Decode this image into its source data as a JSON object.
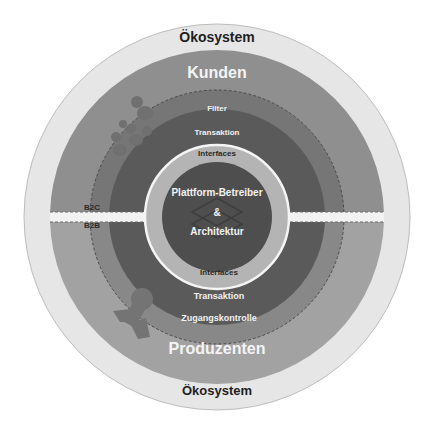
{
  "diagram": {
    "outer_ring": {
      "top_label": "Ökosystem",
      "bottom_label": "Ökosystem",
      "color": "#e4e4e4"
    },
    "customers": {
      "label": "Kunden",
      "color": "#8f8f8f"
    },
    "producers": {
      "label": "Produzenten",
      "color": "#a4a4a4"
    },
    "segments": {
      "b2c": "B2C",
      "b2b": "B2B"
    },
    "upper_layers": {
      "filter": "Filter",
      "transaction": "Transaktion",
      "interfaces": "Interfaces"
    },
    "lower_layers": {
      "interfaces": "Interfaces",
      "transaction": "Transaktion",
      "access_control": "Zugangskontrolle"
    },
    "core": {
      "line1": "Plattform-Betreiber",
      "line2": "&",
      "line3": "Architektur",
      "color": "#4e4e4e"
    },
    "colors": {
      "filter_band_top": "#7a7a7a",
      "filter_band_bottom": "#8a8a8a",
      "transaction_band": "#5c5c5c",
      "interfaces_band": "#b4b4b4",
      "divider": "#f2f2f2"
    }
  }
}
